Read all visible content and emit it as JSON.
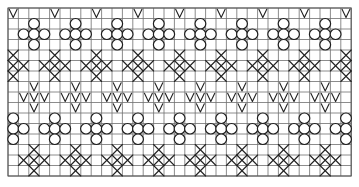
{
  "diagram": {
    "type": "knitting-chart-grid",
    "grid": {
      "columns": 33,
      "rows": 16,
      "origin_x": 8,
      "origin_y": 8,
      "cell_width": 10.4,
      "cell_height": 10.5,
      "line_color": "#6e6e6e",
      "symbol_color": "#222222",
      "background": "#ffffff"
    },
    "symbol_legend": [
      {
        "id": "v",
        "meaning": "V stitch symbol"
      },
      {
        "id": "oval",
        "meaning": "oval / bobble symbol"
      },
      {
        "id": "x",
        "meaning": "X cross stitch symbol"
      }
    ],
    "bands": [
      {
        "name": "top-v-row",
        "motif": "single-v",
        "row_start": 0,
        "col_offset": 0,
        "repeat": 4
      },
      {
        "name": "upper-flower-band",
        "motif": "flower",
        "row_start": 1,
        "col_offset": 2,
        "repeat": 4
      },
      {
        "name": "upper-x-diamond-band",
        "motif": "x-diamond",
        "row_start": 4,
        "col_offset": 0,
        "repeat": 4
      },
      {
        "name": "zigzag-v-band",
        "motif": "v-cluster",
        "row_start": 7,
        "col_offset": 2,
        "repeat": 4
      },
      {
        "name": "lower-flower-band",
        "motif": "flower",
        "row_start": 10,
        "col_offset": 0,
        "repeat": 4
      },
      {
        "name": "lower-x-diamond-band",
        "motif": "x-diamond",
        "row_start": 13,
        "col_offset": 2,
        "repeat": 4
      }
    ],
    "motifs": {
      "single-v": [
        {
          "dr": 0,
          "dc": 0,
          "sym": "v"
        }
      ],
      "flower": [
        {
          "dr": 0,
          "dc": 0,
          "sym": "oval"
        },
        {
          "dr": 1,
          "dc": -1,
          "sym": "oval"
        },
        {
          "dr": 1,
          "dc": 0,
          "sym": "oval"
        },
        {
          "dr": 1,
          "dc": 1,
          "sym": "oval"
        },
        {
          "dr": 2,
          "dc": 0,
          "sym": "oval"
        }
      ],
      "x-diamond": [
        {
          "dr": 0,
          "dc": 0,
          "sym": "x"
        },
        {
          "dr": 1,
          "dc": -1,
          "sym": "x"
        },
        {
          "dr": 1,
          "dc": 0,
          "sym": "x"
        },
        {
          "dr": 1,
          "dc": 1,
          "sym": "x"
        },
        {
          "dr": 2,
          "dc": 0,
          "sym": "x"
        }
      ],
      "v-cluster": [
        {
          "dr": 0,
          "dc": 0,
          "sym": "v"
        },
        {
          "dr": 1,
          "dc": -1,
          "sym": "v"
        },
        {
          "dr": 1,
          "dc": 0,
          "sym": "v"
        },
        {
          "dr": 1,
          "dc": 1,
          "sym": "v"
        },
        {
          "dr": 2,
          "dc": 0,
          "sym": "v"
        }
      ]
    }
  }
}
